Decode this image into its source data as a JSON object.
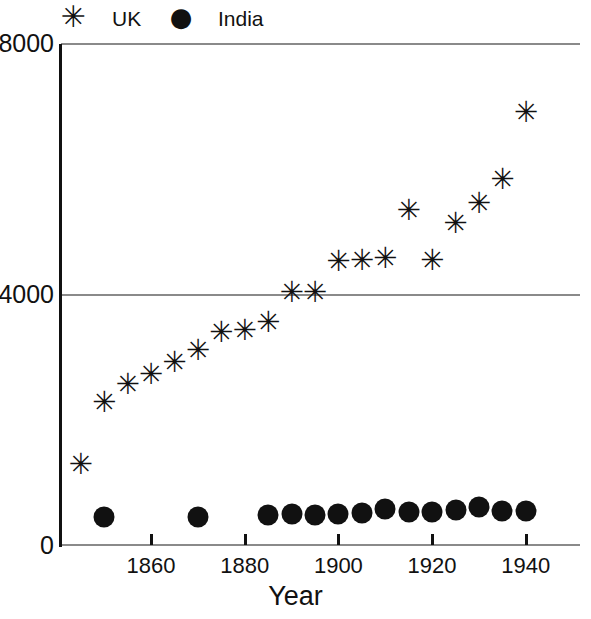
{
  "chart_data": {
    "type": "scatter",
    "title": "",
    "xlabel": "Year",
    "ylabel": "",
    "xlim": [
      1843,
      1944
    ],
    "ylim": [
      0,
      8000
    ],
    "grid": true,
    "legend_position": "top",
    "x_ticks": [
      1860,
      1880,
      1900,
      1920,
      1940
    ],
    "y_ticks": [
      0,
      4000,
      8000
    ],
    "series": [
      {
        "name": "UK",
        "marker": "asterisk",
        "color": "#111111",
        "points": [
          {
            "x": 1845,
            "y": 1270
          },
          {
            "x": 1850,
            "y": 2270
          },
          {
            "x": 1855,
            "y": 2560
          },
          {
            "x": 1860,
            "y": 2720
          },
          {
            "x": 1865,
            "y": 2900
          },
          {
            "x": 1870,
            "y": 3100
          },
          {
            "x": 1875,
            "y": 3380
          },
          {
            "x": 1880,
            "y": 3420
          },
          {
            "x": 1885,
            "y": 3550
          },
          {
            "x": 1890,
            "y": 4030
          },
          {
            "x": 1895,
            "y": 4020
          },
          {
            "x": 1900,
            "y": 4520
          },
          {
            "x": 1905,
            "y": 4540
          },
          {
            "x": 1910,
            "y": 4570
          },
          {
            "x": 1915,
            "y": 5340
          },
          {
            "x": 1920,
            "y": 4540
          },
          {
            "x": 1925,
            "y": 5130
          },
          {
            "x": 1930,
            "y": 5440
          },
          {
            "x": 1935,
            "y": 5830
          },
          {
            "x": 1940,
            "y": 6900
          }
        ]
      },
      {
        "name": "India",
        "marker": "circle",
        "color": "#111111",
        "points": [
          {
            "x": 1850,
            "y": 440
          },
          {
            "x": 1870,
            "y": 450
          },
          {
            "x": 1885,
            "y": 480
          },
          {
            "x": 1890,
            "y": 490
          },
          {
            "x": 1895,
            "y": 480
          },
          {
            "x": 1900,
            "y": 490
          },
          {
            "x": 1905,
            "y": 510
          },
          {
            "x": 1910,
            "y": 570
          },
          {
            "x": 1915,
            "y": 530
          },
          {
            "x": 1920,
            "y": 520
          },
          {
            "x": 1925,
            "y": 560
          },
          {
            "x": 1930,
            "y": 600
          },
          {
            "x": 1935,
            "y": 540
          },
          {
            "x": 1940,
            "y": 540
          }
        ]
      }
    ]
  },
  "legend": {
    "items": [
      {
        "marker_glyph": "✳",
        "label": "UK",
        "icon_name": "asterisk-marker-icon"
      },
      {
        "marker_glyph": "●",
        "label": "India",
        "icon_name": "circle-marker-icon"
      }
    ]
  },
  "axes": {
    "y_tick_labels": [
      "0",
      "4000",
      "8000"
    ],
    "x_tick_labels": [
      "1860",
      "1880",
      "1900",
      "1920",
      "1940"
    ],
    "x_axis_title": "Year",
    "grid_color": "#8a8a8a",
    "axis_color": "#111111"
  }
}
